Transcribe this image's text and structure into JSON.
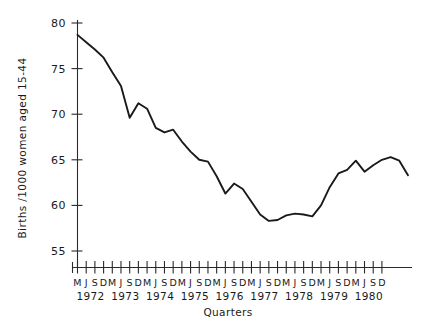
{
  "chart_data": {
    "type": "line",
    "title": "",
    "xlabel": "Quarters",
    "ylabel": "Births /1000 women aged 15-44",
    "ylim": [
      54,
      80
    ],
    "yticks": [
      55,
      60,
      65,
      70,
      75,
      80
    ],
    "ytick_labels": [
      "55",
      "60",
      "65",
      "70",
      "75",
      "80"
    ],
    "grid": false,
    "legend": "none",
    "x": [
      "M",
      "J",
      "S",
      "D",
      "M",
      "J",
      "S",
      "D",
      "M",
      "J",
      "S",
      "D",
      "M",
      "J",
      "S",
      "D",
      "M",
      "J",
      "S",
      "D",
      "M",
      "J",
      "S",
      "D",
      "M",
      "J",
      "S",
      "D",
      "M",
      "J",
      "S",
      "D",
      "M",
      "J",
      "S",
      "D"
    ],
    "xtick_labels": [
      "M",
      "J",
      "S",
      "D",
      "M",
      "J",
      "S",
      "D",
      "M",
      "J",
      "S",
      "D",
      "M",
      "J",
      "S",
      "D",
      "M",
      "J",
      "S",
      "D",
      "M",
      "J",
      "S",
      "D",
      "M",
      "J",
      "S",
      "D",
      "M",
      "J",
      "S",
      "D",
      "M",
      "J",
      "S",
      "D"
    ],
    "year_labels": [
      "1972",
      "1973",
      "1974",
      "1975",
      "1976",
      "1977",
      "1978",
      "1979",
      "1980"
    ],
    "series": [
      {
        "name": "Births per 1000 women aged 15-44",
        "values": [
          78.7,
          77.9,
          77.1,
          76.2,
          74.6,
          73.1,
          69.6,
          71.2,
          70.6,
          68.5,
          68.0,
          68.3,
          67.0,
          65.9,
          65.0,
          64.8,
          63.2,
          61.3,
          62.4,
          61.8,
          60.4,
          59.0,
          58.3,
          58.4,
          58.9,
          59.1,
          59.0,
          58.8,
          60.0,
          62.0,
          63.5,
          63.9,
          64.9,
          63.7,
          64.4,
          65.0
        ]
      }
    ],
    "values_tail": [
      65.3,
      64.9,
      63.3
    ],
    "line_color": "#1a1a1a",
    "background_color": "#ffffff"
  },
  "axis": {
    "y_title": "Births /1000 women aged 15-44",
    "x_title": "Quarters"
  }
}
